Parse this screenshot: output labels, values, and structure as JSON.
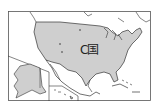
{
  "map": {
    "title": "",
    "country_label": "C国",
    "colors": {
      "land_highlight": "#cfcfcf",
      "land_other": "#ffffff",
      "border": "#333333",
      "background": "#ffffff"
    },
    "insets": [
      "Alaska",
      "Hawaii"
    ]
  }
}
